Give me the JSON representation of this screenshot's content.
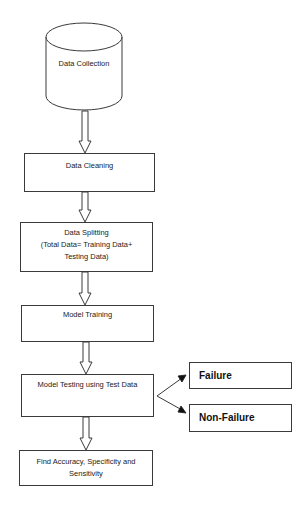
{
  "diagram": {
    "type": "flowchart",
    "colors": {
      "stroke": "#3a3a3a",
      "text": "#222222",
      "background": "#ffffff"
    },
    "nodes": {
      "data_collection": {
        "label": "Data Collection",
        "shape": "cylinder"
      },
      "data_cleaning": {
        "label": "Data Cleaning",
        "shape": "rectangle"
      },
      "data_splitting": {
        "line1": "Data Splitting",
        "line2": "(Total Data= Training Data+",
        "line3": "Testing Data)",
        "shape": "rectangle"
      },
      "model_training": {
        "label": "Model Training",
        "shape": "rectangle"
      },
      "model_testing": {
        "label": "Model Testing using Test Data",
        "shape": "rectangle"
      },
      "failure": {
        "label": "Failure",
        "shape": "rectangle"
      },
      "non_failure": {
        "label": "Non-Failure",
        "shape": "rectangle"
      },
      "find_metrics": {
        "line1": "Find Accuracy, Specificity and",
        "line2": "Sensitivity",
        "shape": "rectangle"
      }
    },
    "edges": [
      {
        "from": "data_collection",
        "to": "data_cleaning",
        "style": "block-arrow"
      },
      {
        "from": "data_cleaning",
        "to": "data_splitting",
        "style": "block-arrow"
      },
      {
        "from": "data_splitting",
        "to": "model_training",
        "style": "block-arrow"
      },
      {
        "from": "model_training",
        "to": "model_testing",
        "style": "block-arrow"
      },
      {
        "from": "model_testing",
        "to": "failure",
        "style": "line-arrow"
      },
      {
        "from": "model_testing",
        "to": "non_failure",
        "style": "line-arrow"
      },
      {
        "from": "model_testing",
        "to": "find_metrics",
        "style": "block-arrow"
      }
    ]
  }
}
